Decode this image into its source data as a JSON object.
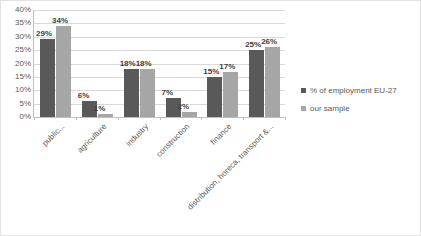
{
  "chart_data": {
    "type": "bar",
    "title": "",
    "subtitle": "",
    "xlabel": "",
    "ylabel": "",
    "ylim": [
      0,
      40
    ],
    "grid": true,
    "legend_position": "right",
    "ytick_labels": [
      "40%",
      "35%",
      "30%",
      "25%",
      "20%",
      "15%",
      "10%",
      "5%",
      "0%"
    ],
    "ytick_values": [
      40,
      35,
      30,
      25,
      20,
      15,
      10,
      5,
      0
    ],
    "categories": [
      "public...",
      "agriculture",
      "industry",
      "construction",
      "finance",
      "distribution, horeca, transport &..."
    ],
    "series": [
      {
        "name": "% of employment EU-27",
        "color": "#595959",
        "values": [
          29,
          6,
          18,
          7,
          15,
          25
        ],
        "labels": [
          "29%",
          "6%",
          "18%",
          "7%",
          "15%",
          "25%"
        ]
      },
      {
        "name": "our sample",
        "color": "#a6a6a6",
        "values": [
          34,
          1,
          18,
          2,
          17,
          26
        ],
        "labels": [
          "34%",
          "1%",
          "18%",
          "2%",
          "17%",
          "26%"
        ]
      }
    ]
  },
  "legend": {
    "items": [
      {
        "label": "% of employment EU-27",
        "color": "#595959"
      },
      {
        "label": "our sample",
        "color": "#a6a6a6"
      }
    ]
  },
  "colors": {
    "series_1": "#595959",
    "series_2": "#a6a6a6",
    "gridline": "#d9d9d9",
    "axis": "#bfbfbf",
    "text": "#595959",
    "border": "#e3e3e3",
    "background": "#ffffff"
  }
}
